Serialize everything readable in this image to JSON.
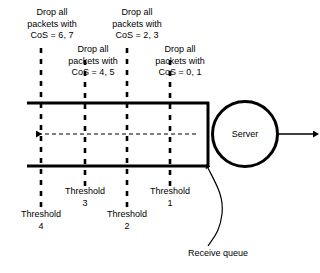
{
  "diagram": {
    "colors": {
      "stroke": "#000000",
      "background": "#ffffff"
    },
    "drop_labels": [
      {
        "id": "drop-cos-6-7",
        "text": "Drop all\npackets with\nCoS = 6, 7",
        "threshold": "4"
      },
      {
        "id": "drop-cos-4-5",
        "text": "Drop all\npackets with\nCoS = 4, 5",
        "threshold": "3"
      },
      {
        "id": "drop-cos-2-3",
        "text": "Drop all\npackets with\nCoS = 2, 3",
        "threshold": "2"
      },
      {
        "id": "drop-cos-0-1",
        "text": "Drop all\npackets with\nCoS = 0, 1",
        "threshold": "1"
      }
    ],
    "threshold_labels": [
      {
        "id": "threshold-4",
        "text": "Threshold\n4"
      },
      {
        "id": "threshold-3",
        "text": "Threshold\n3"
      },
      {
        "id": "threshold-2",
        "text": "Threshold\n2"
      },
      {
        "id": "threshold-1",
        "text": "Threshold\n1"
      }
    ],
    "server": {
      "label": "Server"
    },
    "queue": {
      "callout": "Receive queue"
    }
  }
}
